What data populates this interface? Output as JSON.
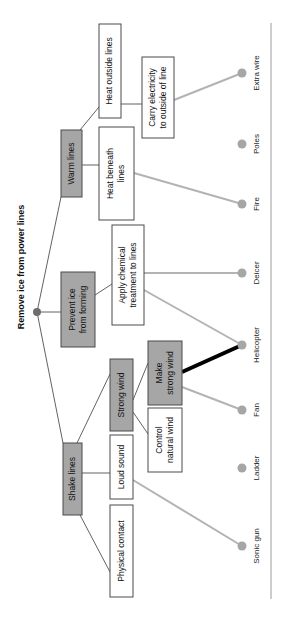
{
  "diagram": {
    "title": "Remove ice from power lines",
    "level1": {
      "warm_lines": "Warm lines",
      "prevent_ice": [
        "Prevent ice",
        "from forming"
      ],
      "shake_lines": "Shake lines"
    },
    "level2": {
      "heat_outside": "Heat outside lines",
      "heat_beneath": [
        "Heat beneath",
        "lines"
      ],
      "apply_chemical": [
        "Apply chemical",
        "treatment to lines"
      ],
      "strong_wind": "Strong wind",
      "loud_sound": "Loud sound",
      "physical_contact": "Physical contact"
    },
    "level3": {
      "carry_electricity": [
        "Carry electricity",
        "to outside of line"
      ],
      "make_strong_wind": [
        "Make",
        "strong wind"
      ],
      "control_natural_wind": [
        "Control",
        "natural wind"
      ]
    },
    "solutions": [
      "Extra wire",
      "Poles",
      "Fire",
      "Deicer",
      "Helicopter",
      "Fan",
      "Ladder",
      "Sonic gun"
    ],
    "colors": {
      "gray_box": "#a6a6a6",
      "link_gray": "#b3b3b3",
      "link_strong": "#000000"
    }
  }
}
